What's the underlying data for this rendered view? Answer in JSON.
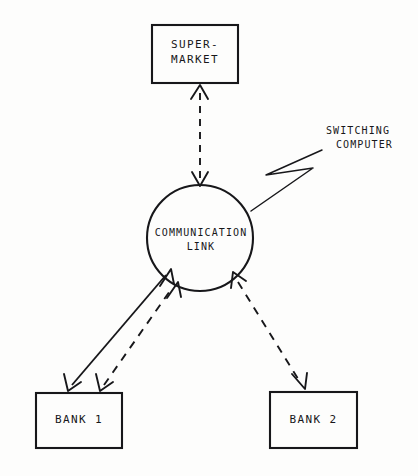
{
  "figure": {
    "type": "block-diagram",
    "background_color": "#fdfdfc",
    "ink_color": "#17171a"
  },
  "nodes": {
    "supermarket": {
      "label": "SUPER-\nMARKET",
      "shape": "rectangle",
      "x": 152,
      "y": 25,
      "width": 86,
      "height": 58
    },
    "communication_link": {
      "label": "COMMUNICATION\nLINK",
      "shape": "circle",
      "cx": 200,
      "cy": 238,
      "r": 53
    },
    "bank_1": {
      "label": "BANK 1",
      "shape": "rectangle",
      "x": 36,
      "y": 393,
      "width": 86,
      "height": 55
    },
    "bank_2": {
      "label": "BANK 2",
      "shape": "rectangle",
      "x": 270,
      "y": 392,
      "width": 87,
      "height": 56
    }
  },
  "annotations": {
    "switching_computer": {
      "line_1": "SWITCHING",
      "line_2": "COMPUTER",
      "leader": "zigzag"
    }
  },
  "connections": [
    {
      "name": "supermarket-to-link",
      "from": "communication_link",
      "to": "supermarket",
      "style": "dashed",
      "arrows": "both"
    },
    {
      "name": "bank1-to-link-solid",
      "from": "bank_1",
      "to": "communication_link",
      "style": "solid",
      "arrows": "both"
    },
    {
      "name": "bank1-to-link-dashed",
      "from": "bank_1",
      "to": "communication_link",
      "style": "dashed",
      "arrows": "both"
    },
    {
      "name": "bank2-to-link-dashed",
      "from": "bank_2",
      "to": "communication_link",
      "style": "dashed",
      "arrows": "both"
    }
  ]
}
